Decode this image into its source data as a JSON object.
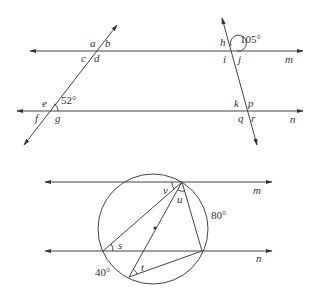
{
  "figure1": {
    "description": "Two parallel lines m and n cut by two transversals",
    "line_labels": {
      "top": "m",
      "bottom": "n"
    },
    "left_transversal": {
      "top_angles": [
        "a",
        "b",
        "c",
        "d"
      ],
      "bottom_angles": [
        "e",
        "f",
        "g"
      ],
      "given_angle": "52°"
    },
    "right_transversal": {
      "top_angles": [
        "h",
        "i",
        "j"
      ],
      "bottom_angles": [
        "k",
        "p",
        "q",
        "r"
      ],
      "given_angle": "105°"
    }
  },
  "figure2": {
    "description": "Circle between parallel lines m and n with inscribed triangle through the center",
    "line_labels": {
      "top": "m",
      "bottom": "n"
    },
    "angle_labels": [
      "v",
      "u",
      "s",
      "t"
    ],
    "arc_labels": {
      "right_arc": "80°",
      "bottom_left_arc": "40°"
    }
  }
}
